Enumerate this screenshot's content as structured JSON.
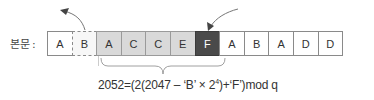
{
  "label": "본문 :",
  "cells": [
    {
      "char": "A",
      "style": "plain"
    },
    {
      "char": "B",
      "style": "dotted"
    },
    {
      "char": "A",
      "style": "shaded"
    },
    {
      "char": "C",
      "style": "shaded"
    },
    {
      "char": "C",
      "style": "shaded"
    },
    {
      "char": "E",
      "style": "shaded"
    },
    {
      "char": "F",
      "style": "dark"
    },
    {
      "char": "A",
      "style": "plain"
    },
    {
      "char": "B",
      "style": "plain"
    },
    {
      "char": "A",
      "style": "plain"
    },
    {
      "char": "D",
      "style": "plain"
    },
    {
      "char": "D",
      "style": "plain"
    }
  ],
  "formula": {
    "prefix": "2052=(2(2047 – ‘B’ × 2",
    "exponent": "4",
    "suffix": ")+‘F’)mod q"
  },
  "arrows": {
    "outgoing": "arrow-out-of-window",
    "incoming": "arrow-into-window"
  },
  "colors": {
    "shaded": "#d9d9d9",
    "dark": "#4a4a4a",
    "border": "#8a8a8a"
  }
}
